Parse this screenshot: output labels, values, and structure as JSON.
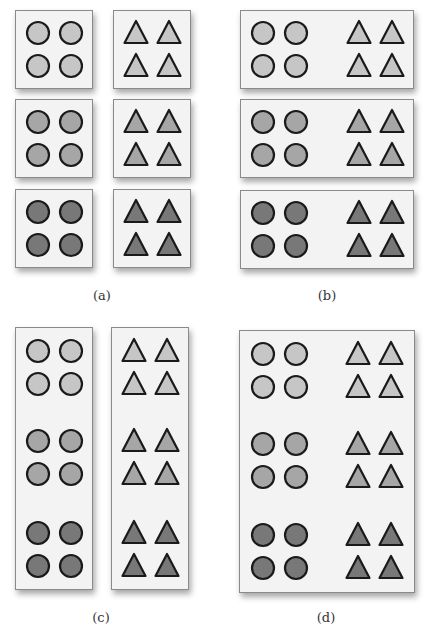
{
  "figure": {
    "colors": {
      "light": "#c6c6c6",
      "mid": "#a6a6a6",
      "dark": "#787878",
      "stroke": "#1a1a1a",
      "box_fill": "#f3f3f3",
      "box_border": "#8a8a8a"
    },
    "panels": [
      {
        "id": "a",
        "caption": "(a)",
        "caption_pos": [
          102,
          288
        ],
        "description": "Six separate boxes: each shade level split into a circle box and a triangle box",
        "boxes": [
          {
            "x": 15,
            "y": 10,
            "w": 78,
            "h": 79,
            "groups": [
              {
                "shape": "circle",
                "shade": "light",
                "cx": 54,
                "cy": 49
              }
            ]
          },
          {
            "x": 113,
            "y": 10,
            "w": 78,
            "h": 79,
            "groups": [
              {
                "shape": "triangle",
                "shade": "light",
                "cx": 152,
                "cy": 49
              }
            ]
          },
          {
            "x": 15,
            "y": 99,
            "w": 78,
            "h": 79,
            "groups": [
              {
                "shape": "circle",
                "shade": "mid",
                "cx": 54,
                "cy": 138
              }
            ]
          },
          {
            "x": 113,
            "y": 99,
            "w": 78,
            "h": 79,
            "groups": [
              {
                "shape": "triangle",
                "shade": "mid",
                "cx": 152,
                "cy": 138
              }
            ]
          },
          {
            "x": 15,
            "y": 189,
            "w": 78,
            "h": 79,
            "groups": [
              {
                "shape": "circle",
                "shade": "dark",
                "cx": 54,
                "cy": 228
              }
            ]
          },
          {
            "x": 113,
            "y": 189,
            "w": 78,
            "h": 79,
            "groups": [
              {
                "shape": "triangle",
                "shade": "dark",
                "cx": 152,
                "cy": 228
              }
            ]
          }
        ]
      },
      {
        "id": "b",
        "caption": "(b)",
        "caption_pos": [
          327,
          288
        ],
        "description": "Three boxes grouped by shade, each containing circles and triangles",
        "boxes": [
          {
            "x": 240,
            "y": 10,
            "w": 174,
            "h": 79,
            "groups": [
              {
                "shape": "circle",
                "shade": "light",
                "cx": 279,
                "cy": 49
              },
              {
                "shape": "triangle",
                "shade": "light",
                "cx": 375,
                "cy": 49
              }
            ]
          },
          {
            "x": 240,
            "y": 99,
            "w": 174,
            "h": 79,
            "groups": [
              {
                "shape": "circle",
                "shade": "mid",
                "cx": 279,
                "cy": 138
              },
              {
                "shape": "triangle",
                "shade": "mid",
                "cx": 375,
                "cy": 138
              }
            ]
          },
          {
            "x": 240,
            "y": 190,
            "w": 174,
            "h": 79,
            "groups": [
              {
                "shape": "circle",
                "shade": "dark",
                "cx": 279,
                "cy": 229
              },
              {
                "shape": "triangle",
                "shade": "dark",
                "cx": 375,
                "cy": 229
              }
            ]
          }
        ]
      },
      {
        "id": "c",
        "caption": "(c)",
        "caption_pos": [
          101,
          610
        ],
        "description": "Two tall boxes grouped by shape: all circles in one, all triangles in the other",
        "boxes": [
          {
            "x": 15,
            "y": 327,
            "w": 78,
            "h": 263,
            "groups": [
              {
                "shape": "circle",
                "shade": "light",
                "cx": 54,
                "cy": 367
              },
              {
                "shape": "circle",
                "shade": "mid",
                "cx": 54,
                "cy": 457
              },
              {
                "shape": "circle",
                "shade": "dark",
                "cx": 54,
                "cy": 549
              }
            ]
          },
          {
            "x": 111,
            "y": 327,
            "w": 78,
            "h": 263,
            "groups": [
              {
                "shape": "triangle",
                "shade": "light",
                "cx": 150,
                "cy": 367
              },
              {
                "shape": "triangle",
                "shade": "mid",
                "cx": 150,
                "cy": 457
              },
              {
                "shape": "triangle",
                "shade": "dark",
                "cx": 150,
                "cy": 549
              }
            ]
          }
        ]
      },
      {
        "id": "d",
        "caption": "(d)",
        "caption_pos": [
          326,
          610
        ],
        "description": "One large box containing all shapes and shades",
        "boxes": [
          {
            "x": 239,
            "y": 330,
            "w": 176,
            "h": 263,
            "groups": [
              {
                "shape": "circle",
                "shade": "light",
                "cx": 279,
                "cy": 370
              },
              {
                "shape": "triangle",
                "shade": "light",
                "cx": 374,
                "cy": 370
              },
              {
                "shape": "circle",
                "shade": "mid",
                "cx": 279,
                "cy": 460
              },
              {
                "shape": "triangle",
                "shade": "mid",
                "cx": 374,
                "cy": 460
              },
              {
                "shape": "circle",
                "shade": "dark",
                "cx": 279,
                "cy": 551
              },
              {
                "shape": "triangle",
                "shade": "dark",
                "cx": 374,
                "cy": 551
              }
            ]
          }
        ]
      }
    ]
  }
}
